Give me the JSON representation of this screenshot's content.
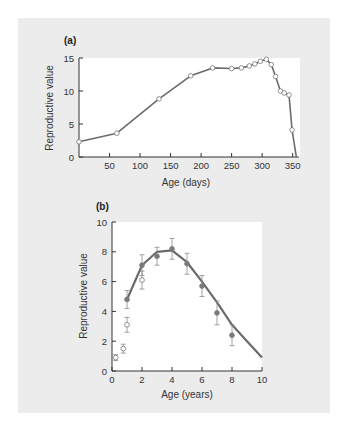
{
  "chart_data": [
    {
      "panel": "(a)",
      "type": "line",
      "title": "",
      "xlabel": "Age (days)",
      "ylabel": "Reproductive value",
      "xlim": [
        0,
        360
      ],
      "ylim": [
        0,
        15
      ],
      "xticks": [
        50,
        100,
        150,
        200,
        250,
        300,
        350
      ],
      "yticks": [
        0,
        5,
        10,
        15
      ],
      "grid": false,
      "series": [
        {
          "name": "Reproductive value",
          "marker": "open-circle",
          "x": [
            0,
            62,
            131,
            183,
            219,
            250,
            266,
            279,
            288,
            297,
            307,
            315,
            322,
            330,
            336,
            344,
            349,
            356
          ],
          "y": [
            2.3,
            3.6,
            8.8,
            12.3,
            13.5,
            13.4,
            13.5,
            13.8,
            14.1,
            14.5,
            14.8,
            14.0,
            12.2,
            10.0,
            9.7,
            9.4,
            4.1,
            0
          ],
          "markers_on": [
            true,
            true,
            true,
            true,
            true,
            true,
            true,
            true,
            true,
            true,
            true,
            true,
            true,
            true,
            true,
            true,
            true,
            false
          ]
        }
      ]
    },
    {
      "panel": "(b)",
      "type": "line",
      "title": "",
      "xlabel": "Age (years)",
      "ylabel": "Reproductive value",
      "xlim": [
        0,
        10
      ],
      "ylim": [
        0,
        10
      ],
      "xticks": [
        0,
        2,
        4,
        6,
        8,
        10
      ],
      "yticks": [
        0,
        2,
        4,
        6,
        8,
        10
      ],
      "grid": false,
      "series": [
        {
          "name": "Model (line)",
          "x": [
            1,
            2,
            3,
            4,
            5,
            6,
            7,
            8,
            9,
            10
          ],
          "y": [
            4.8,
            7.1,
            8.0,
            8.1,
            7.3,
            6.0,
            4.6,
            3.1,
            2.0,
            0.9
          ]
        },
        {
          "name": "Observed (filled)",
          "marker": "filled-circle",
          "x": [
            1,
            2,
            3,
            4,
            5,
            6,
            7,
            8
          ],
          "y": [
            4.8,
            7.1,
            7.7,
            8.2,
            7.2,
            5.7,
            3.9,
            2.4
          ],
          "err": [
            0.6,
            0.7,
            0.6,
            0.7,
            0.7,
            0.7,
            0.8,
            0.7
          ]
        },
        {
          "name": "Observed (open)",
          "marker": "open-circle",
          "x": [
            0.25,
            0.75,
            1,
            2
          ],
          "y": [
            0.9,
            1.5,
            3.1,
            6.1
          ],
          "err": [
            0.2,
            0.3,
            0.5,
            0.6
          ]
        }
      ]
    }
  ],
  "labels": {
    "a": "(a)",
    "b": "(b)",
    "a_xlabel": "Age (days)",
    "a_ylabel": "Reproductive value",
    "b_xlabel": "Age (years)",
    "b_ylabel": "Reproductive value"
  },
  "colors": {
    "panel_bg": "#ececec",
    "plot_bg": "#ffffff",
    "line": "#6b6b6b",
    "marker_fill_open": "#ffffff",
    "marker_fill_solid": "#7a7a7a",
    "axis": "#333333"
  }
}
